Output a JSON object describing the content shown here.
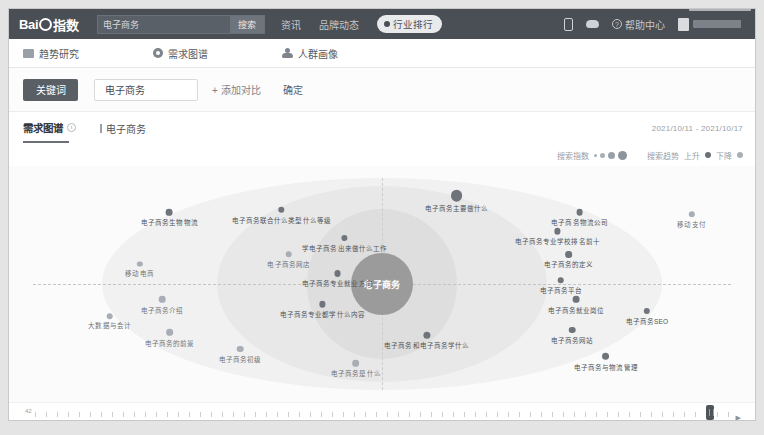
{
  "navbar": {
    "logo_text_left": "Bai",
    "logo_text_right": "指数",
    "search_value": "电子商务",
    "search_placeholder": "请输入关键词",
    "search_button": "搜索",
    "links": [
      {
        "label": "资讯"
      },
      {
        "label": "品牌动态"
      }
    ],
    "pill_label": "行业排行",
    "help_label": "帮助中心",
    "icons": {
      "phone": "mobile-icon",
      "cloud": "cloud-icon",
      "question": "?"
    }
  },
  "subnav": {
    "tabs": [
      {
        "label": "趋势研究",
        "icon": "chart-icon",
        "active": false
      },
      {
        "label": "需求图谱",
        "icon": "graph-icon",
        "active": true
      },
      {
        "label": "人群画像",
        "icon": "people-icon",
        "active": false
      }
    ]
  },
  "filterbar": {
    "keyword_button": "关键词",
    "keyword_value": "电子商务",
    "keyword_placeholder": "请输入关键词",
    "add_compare": "+ 添加对比",
    "confirm": "确定"
  },
  "titlerow": {
    "title": "需求图谱",
    "info_glyph": "i",
    "keyword": "电子商务",
    "date_range": "2021/10/11 - 2021/10/17"
  },
  "legend": {
    "size_label": "搜索指数",
    "trend_label": "搜索趋势",
    "rise_label": "上升",
    "fall_label": "下降"
  },
  "chart_data": {
    "type": "scatter",
    "title": "需求图谱",
    "center_label": "电子商务",
    "xlabel": "",
    "ylabel": "",
    "legend_position": "top-right",
    "grid": false,
    "nodes": [
      {
        "label": "电子商务生物物流",
        "x": 21.5,
        "y": 22,
        "r": 3.4,
        "trend": "rise"
      },
      {
        "label": "电子商务联合什么类型什么等级",
        "x": 36.5,
        "y": 21,
        "r": 3.4,
        "trend": "rise"
      },
      {
        "label": "电子商务主要做什么",
        "x": 60.0,
        "y": 15,
        "r": 5.6,
        "trend": "rise"
      },
      {
        "label": "电子商务物流公司",
        "x": 76.5,
        "y": 22,
        "r": 3.4,
        "trend": "rise"
      },
      {
        "label": "移动支付",
        "x": 91.5,
        "y": 23,
        "r": 3.0,
        "trend": "fall"
      },
      {
        "label": "学电子商务出来做什么工作",
        "x": 45.0,
        "y": 33,
        "r": 3.2,
        "trend": "rise"
      },
      {
        "label": "电子商务专业学校排名前十",
        "x": 73.5,
        "y": 30,
        "r": 3.4,
        "trend": "rise"
      },
      {
        "label": "电子商务网店",
        "x": 37.5,
        "y": 40,
        "r": 3.0,
        "trend": "fall"
      },
      {
        "label": "电子商务的定义",
        "x": 75.0,
        "y": 40,
        "r": 3.2,
        "trend": "rise"
      },
      {
        "label": "电子商务专业就业方向",
        "x": 44.0,
        "y": 48,
        "r": 3.2,
        "trend": "rise"
      },
      {
        "label": "移动电商",
        "x": 17.5,
        "y": 44,
        "r": 2.8,
        "trend": "fall"
      },
      {
        "label": "电子商务平台",
        "x": 74.0,
        "y": 51,
        "r": 3.0,
        "trend": "rise"
      },
      {
        "label": "电子商务介绍",
        "x": 20.5,
        "y": 59,
        "r": 3.4,
        "trend": "fall"
      },
      {
        "label": "大数据与会计",
        "x": 13.5,
        "y": 66,
        "r": 3.0,
        "trend": "fall"
      },
      {
        "label": "电子商务专业都学什么内容",
        "x": 42.0,
        "y": 61,
        "r": 3.4,
        "trend": "rise"
      },
      {
        "label": "电子商务就业岗位",
        "x": 76.0,
        "y": 59,
        "r": 3.4,
        "trend": "rise"
      },
      {
        "label": "电子商务SEO",
        "x": 85.5,
        "y": 64,
        "r": 3.2,
        "trend": "rise"
      },
      {
        "label": "电子商务的前景",
        "x": 21.5,
        "y": 73,
        "r": 3.4,
        "trend": "fall"
      },
      {
        "label": "电子商务网站",
        "x": 75.5,
        "y": 72,
        "r": 3.2,
        "trend": "rise"
      },
      {
        "label": "电子商务和电子商务学什么",
        "x": 56.0,
        "y": 74,
        "r": 3.6,
        "trend": "rise"
      },
      {
        "label": "电子商务初级",
        "x": 31.0,
        "y": 80,
        "r": 3.2,
        "trend": "fall"
      },
      {
        "label": "电子商务是什么",
        "x": 46.5,
        "y": 86,
        "r": 3.4,
        "trend": "fall"
      },
      {
        "label": "电子商务与物流管理",
        "x": 80.0,
        "y": 83,
        "r": 3.6,
        "trend": "rise"
      }
    ]
  },
  "timeline": {
    "left_label": "42",
    "arrow": "▶",
    "ticks": [
      {
        "label": "10月",
        "pos": 2.0
      },
      {
        "label": "11月",
        "pos": 14.5
      },
      {
        "label": "2021年1月",
        "pos": 28.0
      },
      {
        "label": "2月",
        "pos": 42.5
      },
      {
        "label": "3月",
        "pos": 54.5
      },
      {
        "label": "4月",
        "pos": 66.5
      },
      {
        "label": "5月",
        "pos": 78.0
      },
      {
        "label": "6月",
        "pos": 88.5
      },
      {
        "label": "8月",
        "pos": 96.2
      }
    ],
    "right_ticks": [
      {
        "label": "9月",
        "pos": 68.5
      },
      {
        "label": "10月",
        "pos": 86.0
      }
    ],
    "handle_pos": 94.0
  }
}
